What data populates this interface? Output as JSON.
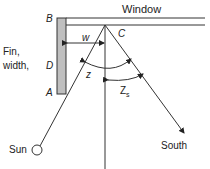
{
  "labels": {
    "window": "Window",
    "b": "B",
    "c": "C",
    "d": "D",
    "a": "A",
    "w": "w",
    "z": "z",
    "zs_base": "Z",
    "zs_sub": "s",
    "fin_line1": "Fin,",
    "fin_line2": "width,",
    "sun": "Sun",
    "south": "South"
  },
  "colors": {
    "line": "#333333",
    "fin_fill": "#bfbfbf",
    "text": "#222222"
  }
}
